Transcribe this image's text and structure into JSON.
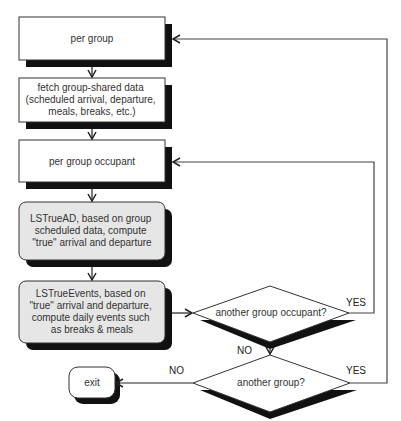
{
  "diagram": {
    "type": "flowchart",
    "colors": {
      "line": "#333333",
      "shadow": "#111111",
      "box_fill": "#ffffff",
      "process_fill": "#e6e6e6"
    },
    "nodes": {
      "per_group": {
        "label": [
          "per group"
        ]
      },
      "fetch_data": {
        "label": [
          "fetch group-shared data",
          "(scheduled arrival, departure,",
          "meals, breaks, etc.)"
        ]
      },
      "per_occupant": {
        "label": [
          "per group occupant"
        ]
      },
      "ls_true_ad": {
        "label": [
          "LSTrueAD, based on group",
          "scheduled data, compute",
          "\"true\" arrival and departure"
        ]
      },
      "ls_true_events": {
        "label": [
          "LSTrueEvents, based on",
          "\"true\" arrival and departure,",
          "compute daily events such",
          "as breaks & meals"
        ]
      },
      "another_occupant": {
        "label": [
          "another group occupant?"
        ]
      },
      "another_group": {
        "label": [
          "another group?"
        ]
      },
      "exit": {
        "label": [
          "exit"
        ]
      }
    },
    "edges": {
      "occupant_yes": "YES",
      "occupant_no": "NO",
      "group_yes": "YES",
      "group_no": "NO"
    }
  }
}
